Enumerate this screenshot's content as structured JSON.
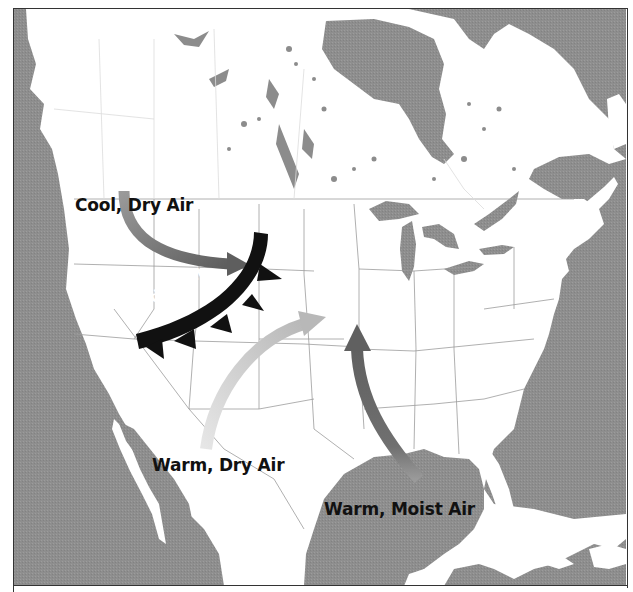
{
  "figure": {
    "type": "weather-map",
    "region": "North America",
    "colors": {
      "water": "#8c8c8c",
      "land": "#ffffff",
      "borders": "#9a9a9a",
      "cold_front": "#111111",
      "cool_dry_arrow": "#7d7d7d",
      "warm_dry_arrow": "#d4d4d4",
      "warm_moist_arrow": "#6e6e6e"
    }
  },
  "labels": {
    "cool_dry_air": "Cool, Dry Air",
    "cold_front": "Cold Front",
    "warm_dry_air": "Warm, Dry Air",
    "warm_moist_air": "Warm, Moist Air"
  },
  "icons": {
    "cool_dry_arrow": "arrow-curved-right",
    "warm_dry_arrow": "arrow-curved-up-right",
    "warm_moist_arrow": "arrow-curved-up",
    "cold_front_symbol": "cold-front-triangles"
  }
}
